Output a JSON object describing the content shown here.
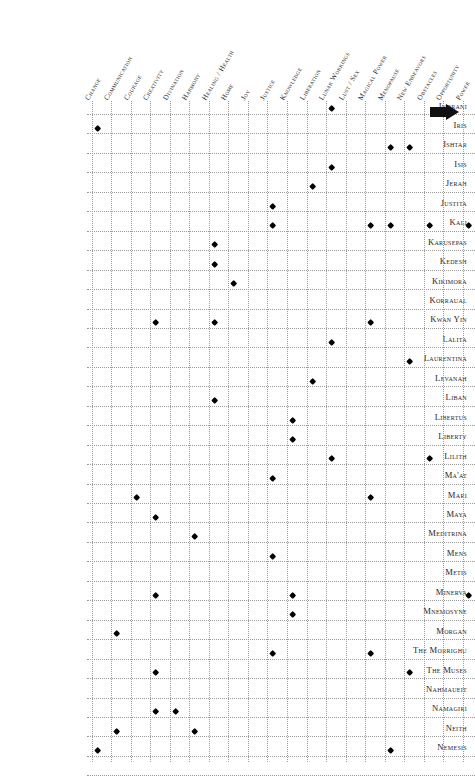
{
  "table": {
    "kind": "goddess-correspondence-matrix",
    "columns": [
      "Change",
      "Communication",
      "Courage",
      "Creativity",
      "Divination",
      "Harmony",
      "Healing / Health",
      "Home",
      "Joy",
      "Justice",
      "Knowledge",
      "Liberation",
      "Lunar Workings",
      "Lust / Sex",
      "Magical Power",
      "Menopause",
      "New Endeavors",
      "Obstacles",
      "Opportunity",
      "Power"
    ],
    "rows": [
      {
        "label": "Indrani",
        "marks": [
          12
        ]
      },
      {
        "label": "Iris",
        "marks": [
          0
        ]
      },
      {
        "label": "Ishtar",
        "marks": [
          15,
          16
        ]
      },
      {
        "label": "Isis",
        "marks": [
          12
        ]
      },
      {
        "label": "Jerah",
        "marks": [
          11
        ]
      },
      {
        "label": "Justita",
        "marks": [
          9
        ]
      },
      {
        "label": "Kali",
        "marks": [
          9,
          14,
          15,
          17,
          19
        ]
      },
      {
        "label": "Karusepas",
        "marks": [
          6
        ]
      },
      {
        "label": "Kedesh",
        "marks": [
          6
        ]
      },
      {
        "label": "Kikimora",
        "marks": [
          7
        ]
      },
      {
        "label": "Korraual",
        "marks": []
      },
      {
        "label": "Kwan Yin",
        "marks": [
          3,
          6,
          14
        ]
      },
      {
        "label": "Lalita",
        "marks": [
          12
        ]
      },
      {
        "label": "Laurentina",
        "marks": [
          16
        ]
      },
      {
        "label": "Levanah",
        "marks": [
          11
        ]
      },
      {
        "label": "Liban",
        "marks": [
          6
        ]
      },
      {
        "label": "Libertus",
        "marks": [
          10
        ]
      },
      {
        "label": "Liberty",
        "marks": [
          10
        ]
      },
      {
        "label": "Lilith",
        "marks": [
          12,
          17
        ]
      },
      {
        "label": "Ma'at",
        "marks": [
          9
        ]
      },
      {
        "label": "Mari",
        "marks": [
          2,
          14
        ]
      },
      {
        "label": "Maya",
        "marks": [
          3
        ]
      },
      {
        "label": "Meditrina",
        "marks": [
          5
        ]
      },
      {
        "label": "Mens",
        "marks": [
          9
        ]
      },
      {
        "label": "Metis",
        "marks": []
      },
      {
        "label": "Minerva",
        "marks": [
          3,
          10,
          19
        ]
      },
      {
        "label": "Mnemosyne",
        "marks": [
          10
        ]
      },
      {
        "label": "Morgan",
        "marks": [
          1
        ]
      },
      {
        "label": "The Morrighu",
        "marks": [
          9,
          14
        ]
      },
      {
        "label": "The Muses",
        "marks": [
          3,
          16
        ]
      },
      {
        "label": "Nahmaueit",
        "marks": []
      },
      {
        "label": "Namagiri",
        "marks": [
          3,
          4
        ]
      },
      {
        "label": "Neith",
        "marks": [
          1,
          5
        ]
      },
      {
        "label": "Nemesis",
        "marks": [
          0,
          15
        ]
      }
    ]
  },
  "cursor": {
    "icon": "right-arrow-pointer"
  },
  "style": {
    "grid_color": "#9a9a9a",
    "mark_color": "#000000",
    "text_color": "#1e1e1e",
    "background": "#ffffff"
  }
}
